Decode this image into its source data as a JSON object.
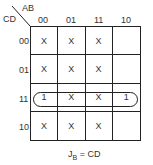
{
  "kmap": {
    "row_var": "CD",
    "col_var": "AB",
    "col_headers": [
      "00",
      "01",
      "11",
      "10"
    ],
    "row_headers": [
      "00",
      "01",
      "11",
      "10"
    ],
    "cells": [
      [
        "X",
        "X",
        "X",
        ""
      ],
      [
        "X",
        "X",
        "X",
        ""
      ],
      [
        "1",
        "X",
        "X",
        "1"
      ],
      [
        "X",
        "X",
        "X",
        ""
      ]
    ],
    "groups": [
      {
        "row": "11",
        "cols": [
          "00",
          "01",
          "11",
          "10"
        ]
      }
    ]
  },
  "equation": {
    "lhs": "J",
    "sub": "B",
    "rhs": "= CD"
  }
}
